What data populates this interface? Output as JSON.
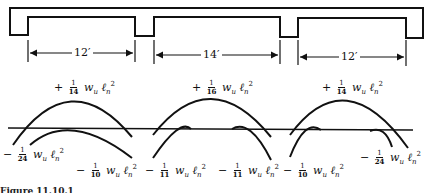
{
  "figure": {
    "caption_partial": "Figure 11.10.1",
    "beam": {
      "description": "Continuous slab with supporting beams (three spans)",
      "spans": [
        {
          "label": "12′",
          "length_ft": 12
        },
        {
          "label": "14′",
          "length_ft": 14
        },
        {
          "label": "12′",
          "length_ft": 12
        }
      ]
    },
    "moments": {
      "positive": [
        {
          "sign": "+",
          "num": "1",
          "den": "14",
          "expr": "w",
          "sub_w": "u",
          "l": "ℓ",
          "sub_l": "n",
          "exp": "2"
        },
        {
          "sign": "+",
          "num": "1",
          "den": "16",
          "expr": "w",
          "sub_w": "u",
          "l": "ℓ",
          "sub_l": "n",
          "exp": "2"
        },
        {
          "sign": "+",
          "num": "1",
          "den": "14",
          "expr": "w",
          "sub_w": "u",
          "l": "ℓ",
          "sub_l": "n",
          "exp": "2"
        }
      ],
      "negative": [
        {
          "sign": "−",
          "num": "1",
          "den": "24",
          "expr": "w",
          "sub_w": "u",
          "l": "ℓ",
          "sub_l": "n",
          "exp": "2"
        },
        {
          "sign": "−",
          "num": "1",
          "den": "10",
          "expr": "w",
          "sub_w": "u",
          "l": "ℓ",
          "sub_l": "n",
          "exp": "2"
        },
        {
          "sign": "−",
          "num": "1",
          "den": "11",
          "expr": "w",
          "sub_w": "u",
          "l": "ℓ",
          "sub_l": "n",
          "exp": "2"
        },
        {
          "sign": "−",
          "num": "1",
          "den": "11",
          "expr": "w",
          "sub_w": "u",
          "l": "ℓ",
          "sub_l": "n",
          "exp": "2"
        },
        {
          "sign": "−",
          "num": "1",
          "den": "10",
          "expr": "w",
          "sub_w": "u",
          "l": "ℓ",
          "sub_l": "n",
          "exp": "2"
        },
        {
          "sign": "−",
          "num": "1",
          "den": "24",
          "expr": "w",
          "sub_w": "u",
          "l": "ℓ",
          "sub_l": "n",
          "exp": "2"
        }
      ]
    },
    "colors": {
      "ink": "#111111",
      "background": "#ffffff"
    }
  }
}
